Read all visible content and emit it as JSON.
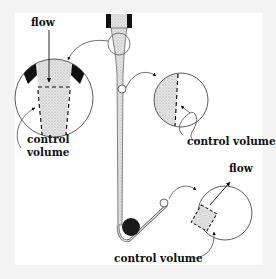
{
  "diagram": {
    "labels": {
      "flow_top": "flow",
      "control_volume_left_line1": "control",
      "control_volume_left_line2": "volume",
      "control_volume_right": "control volume",
      "flow_bottom": "flow",
      "control_volume_bottom": "control volume"
    },
    "colors": {
      "background": "#f3f3f3",
      "panel": "#ffffff",
      "fluid_fill": "#d9d9d9",
      "solid": "#111111",
      "line": "#333333"
    },
    "elements": [
      "nozzle",
      "liquid-jet-stream",
      "sphere-at-bottom",
      "inset-circle-nozzle-exit",
      "inset-circle-stream-side",
      "inset-circle-sphere-wake"
    ]
  }
}
